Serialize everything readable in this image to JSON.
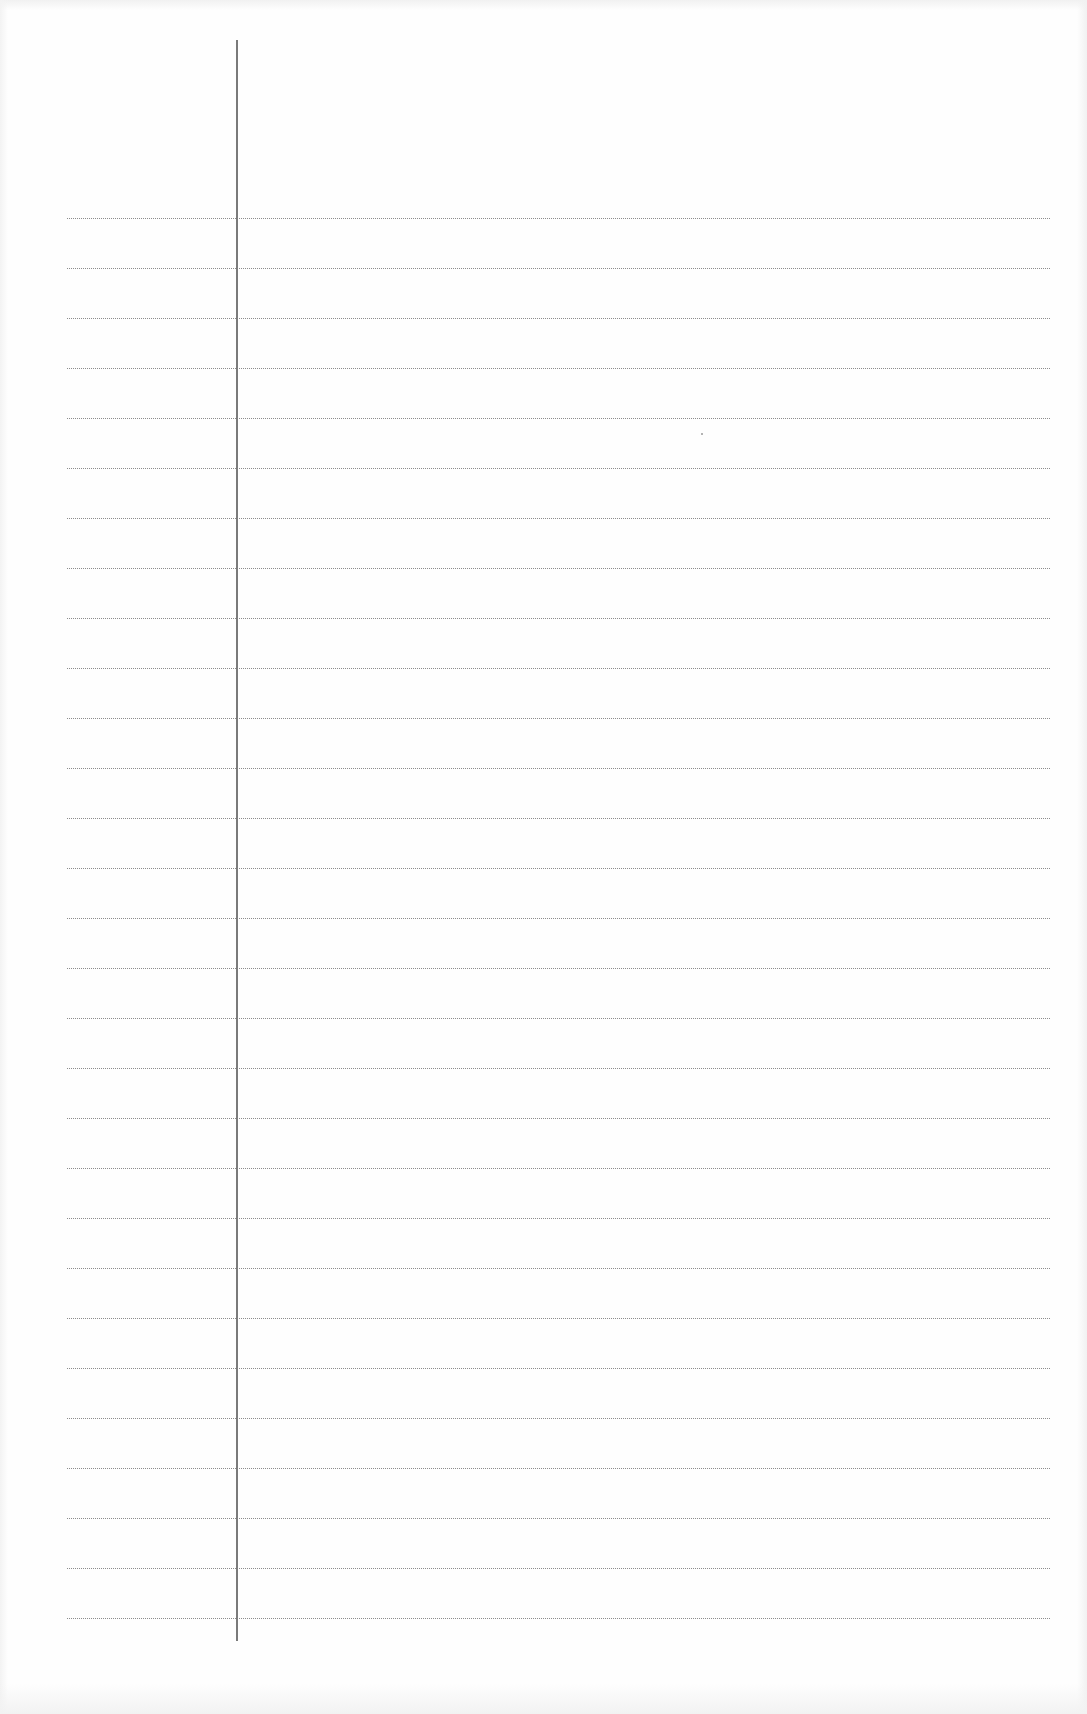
{
  "page": {
    "type": "blank-ruled-notebook-page",
    "background_color": "#fefefe",
    "rule_line_color": "#8c8c8c",
    "margin_line_color": "#7a7a7a"
  },
  "rules": {
    "count": 29,
    "first_y": 218,
    "spacing": 50,
    "left_x": 67,
    "right_x": 1050
  },
  "margin": {
    "x": 236,
    "top_y": 40,
    "bottom_y": 1641
  },
  "marks": [
    {
      "x": 701,
      "y": 433
    }
  ]
}
